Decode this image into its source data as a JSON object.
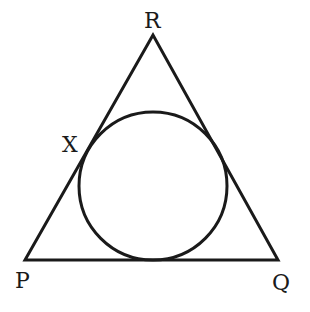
{
  "diagram": {
    "type": "triangle-with-incircle",
    "stroke_color": "#1a1a1a",
    "background": "#ffffff",
    "vertices": {
      "R": {
        "label": "R",
        "x": 153,
        "y": 35
      },
      "P": {
        "label": "P",
        "x": 25,
        "y": 260
      },
      "Q": {
        "label": "Q",
        "x": 278,
        "y": 260
      }
    },
    "incircle": {
      "cx": 153,
      "cy": 186,
      "r": 74
    },
    "points": {
      "X": {
        "label": "X"
      }
    },
    "labels": {
      "R": "R",
      "P": "P",
      "Q": "Q",
      "X": "X"
    }
  }
}
